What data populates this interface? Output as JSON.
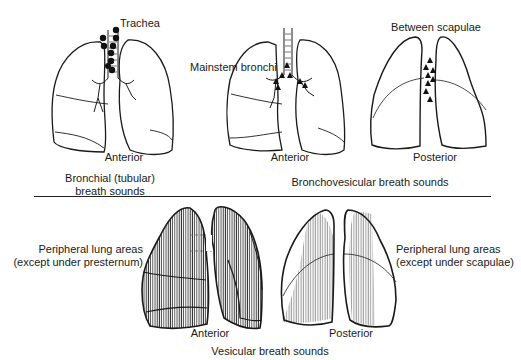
{
  "diagram": {
    "top_section": {
      "bronchial": {
        "view_label": "Anterior",
        "location_label": "Trachea",
        "caption_line1": "Bronchial (tubular)",
        "caption_line2": "breath sounds",
        "marker": "filled-circle"
      },
      "bronchovesicular": {
        "caption": "Bronchovesicular breath sounds",
        "anterior": {
          "view_label": "Anterior",
          "location_label": "Mainstem bronchi",
          "marker": "filled-triangle"
        },
        "posterior": {
          "view_label": "Posterior",
          "location_label": "Between scapulae",
          "marker": "filled-triangle"
        }
      }
    },
    "bottom_section": {
      "caption": "Vesicular breath sounds",
      "anterior": {
        "view_label": "Anterior",
        "area_line1": "Peripheral lung areas",
        "area_line2": "(except under presternum)"
      },
      "posterior": {
        "view_label": "Posterior",
        "area_line1": "Peripheral lung areas",
        "area_line2": "(except under scapulae)"
      }
    },
    "colors": {
      "line": "#1a1a1a",
      "background": "#ffffff",
      "hatch": "#333333"
    }
  }
}
